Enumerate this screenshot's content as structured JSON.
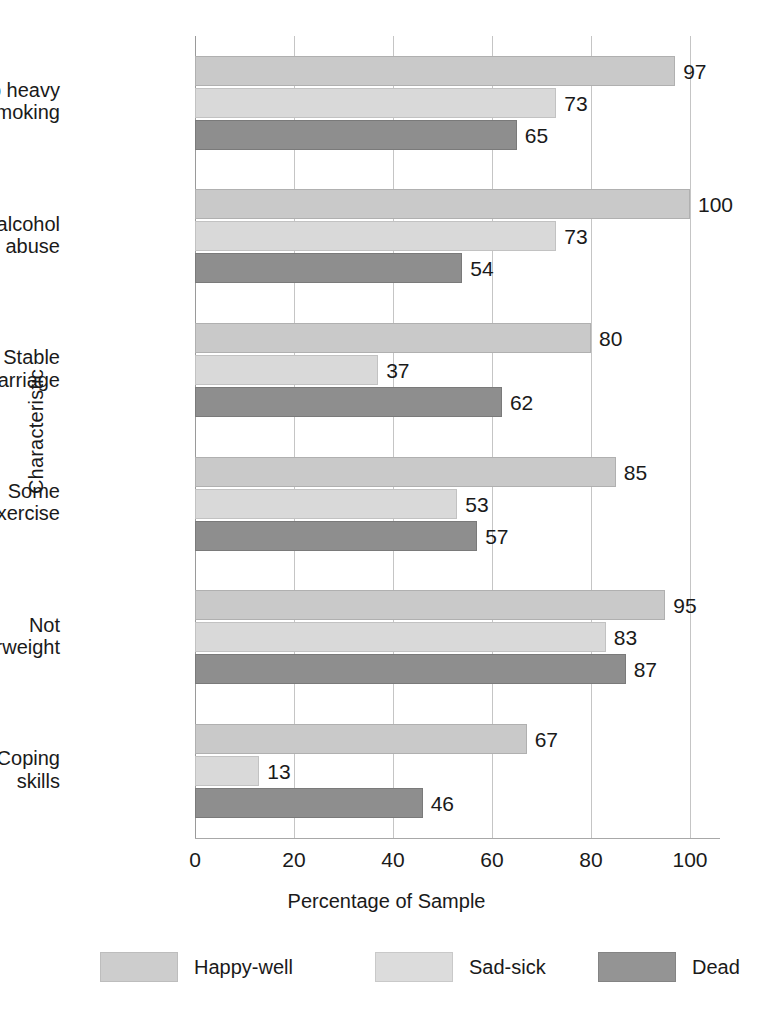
{
  "chart_data": {
    "type": "bar",
    "orientation": "horizontal",
    "title": "",
    "xlabel": "Percentage of Sample",
    "ylabel": "Characteristic",
    "xlim": [
      0,
      100
    ],
    "xticks": [
      0,
      20,
      40,
      60,
      80,
      100
    ],
    "grid": true,
    "legend_position": "bottom",
    "categories": [
      "No heavy smoking",
      "No alcohol abuse",
      "Stable marriage",
      "Some exercise",
      "Not overweight",
      "Coping skills"
    ],
    "category_lines": [
      [
        "No heavy",
        "smoking"
      ],
      [
        "No alcohol",
        "abuse"
      ],
      [
        "Stable",
        "marriage"
      ],
      [
        "Some",
        "exercise"
      ],
      [
        "Not",
        "overweight"
      ],
      [
        "Coping",
        "skills"
      ]
    ],
    "series": [
      {
        "name": "Happy-well",
        "color": "#c9c9c9",
        "values": [
          97,
          100,
          80,
          85,
          95,
          67
        ]
      },
      {
        "name": "Sad-sick",
        "color": "#d9d9d9",
        "values": [
          73,
          73,
          37,
          53,
          83,
          13
        ]
      },
      {
        "name": "Dead",
        "color": "#8e8e8e",
        "values": [
          65,
          54,
          62,
          57,
          87,
          46
        ]
      }
    ]
  }
}
